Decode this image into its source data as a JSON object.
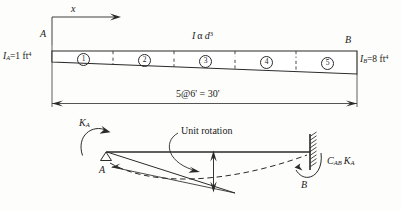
{
  "figure": {
    "stroke_color": "#2a2a2a",
    "background_color": "#fdfdfb"
  },
  "beam_diagram": {
    "axis_label_x": "x",
    "node_label_left": "A",
    "node_label_right": "B",
    "inertia_left": {
      "symbol": "I",
      "subscript": "A",
      "equals": "=",
      "value": "1 ft",
      "exponent": "4"
    },
    "inertia_right": {
      "symbol": "I",
      "subscript": "B",
      "equals": "=",
      "value": "8 ft",
      "exponent": "4"
    },
    "inertia_relation": {
      "symbol": "I",
      "alpha": "α",
      "depth": "d",
      "exponent": "3"
    },
    "segments": [
      {
        "label": "1",
        "glyph": "①"
      },
      {
        "label": "2",
        "glyph": "②"
      },
      {
        "label": "3",
        "glyph": "③"
      },
      {
        "label": "4",
        "glyph": "④"
      },
      {
        "label": "5",
        "glyph": "⑤"
      }
    ],
    "dimension": {
      "text": "5@6' = 30'",
      "count": 5,
      "spacing": "6'",
      "total": "30'"
    }
  },
  "deflection_diagram": {
    "applied_moment_label": {
      "symbol": "K",
      "subscript": "A"
    },
    "carryover_moment_label": {
      "prefix": "C",
      "prefix_sub": "AB",
      "symbol": "K",
      "symbol_sub": "A"
    },
    "rotation_annotation": "Unit rotation",
    "node_label_left": "A",
    "node_label_right": "B",
    "support_left_type": "pin",
    "support_right_type": "fixed"
  }
}
